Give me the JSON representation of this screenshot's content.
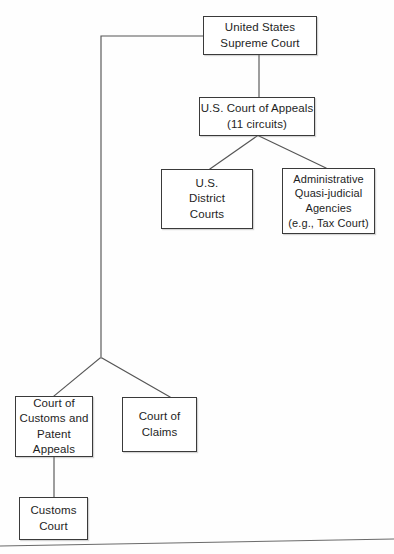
{
  "diagram": {
    "nodes": {
      "supreme_court": {
        "label": "United States\nSupreme Court"
      },
      "court_of_appeals": {
        "label": "U.S. Court of Appeals\n(11 circuits)"
      },
      "district_courts": {
        "label": "U.S.\nDistrict\nCourts"
      },
      "admin_agencies": {
        "label": "Administrative\nQuasi-judicial\nAgencies\n(e.g., Tax Court)"
      },
      "ccpa": {
        "label": "Court of\nCustoms and\nPatent\nAppeals"
      },
      "court_of_claims": {
        "label": "Court of\nClaims"
      },
      "customs_court": {
        "label": "Customs\nCourt"
      }
    },
    "edges": [
      {
        "name": "supreme-court-to-court-of-appeals",
        "from": "supreme_court",
        "to": "court_of_appeals",
        "style": "vertical"
      },
      {
        "name": "supreme-court-to-lower-branch",
        "from": "supreme_court",
        "to": "branch_junction",
        "style": "elbow-left"
      },
      {
        "name": "court-of-appeals-to-district-courts",
        "from": "court_of_appeals",
        "to": "district_courts",
        "style": "diagonal"
      },
      {
        "name": "court-of-appeals-to-admin-agencies",
        "from": "court_of_appeals",
        "to": "admin_agencies",
        "style": "diagonal"
      },
      {
        "name": "branch-junction-to-ccpa",
        "from": "branch_junction",
        "to": "ccpa",
        "style": "diagonal"
      },
      {
        "name": "branch-junction-to-court-of-claims",
        "from": "branch_junction",
        "to": "court_of_claims",
        "style": "diagonal"
      },
      {
        "name": "ccpa-to-customs-court",
        "from": "ccpa",
        "to": "customs_court",
        "style": "vertical"
      }
    ],
    "colors": {
      "line": "#555555",
      "box_border": "#3a3a3a",
      "text": "#1e1e1e",
      "background": "#fefefe"
    }
  }
}
